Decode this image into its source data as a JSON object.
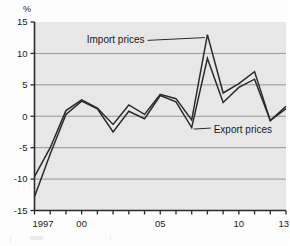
{
  "figure": {
    "unit_label": "%",
    "background_color": "#fdfdfd",
    "plot_background_color": "#e7e7e7"
  },
  "chart_data": {
    "type": "line",
    "title": "",
    "xlabel": "",
    "ylabel": "%",
    "ylim": [
      -15,
      15
    ],
    "ytick_values": [
      15,
      10,
      5,
      0,
      -5,
      -10,
      -15
    ],
    "ytick_labels": [
      "15",
      "10",
      "5",
      "0",
      "-5",
      "-10",
      "-15"
    ],
    "xlim": [
      1997,
      2013
    ],
    "xtick_values": [
      1997,
      1998,
      1999,
      2000,
      2001,
      2002,
      2003,
      2004,
      2005,
      2006,
      2007,
      2008,
      2009,
      2010,
      2011,
      2012,
      2013
    ],
    "xtick_labels": [
      "1997",
      "",
      "",
      "00",
      "",
      "",
      "",
      "",
      "05",
      "",
      "",
      "",
      "",
      "10",
      "",
      "",
      "13"
    ],
    "x": [
      1997,
      1998,
      1999,
      2000,
      2001,
      2002,
      2003,
      2004,
      2005,
      2006,
      2007,
      2008,
      2009,
      2010,
      2011,
      2012,
      2013
    ],
    "grid": true,
    "grid_axis": "y",
    "legend_position": "annotations-inline",
    "series": [
      {
        "name": "Import prices",
        "color": "#2b2b2b",
        "values": [
          -9.6,
          -5.0,
          0.9,
          2.6,
          1.3,
          -1.3,
          1.8,
          0.3,
          3.5,
          2.8,
          -0.6,
          13.0,
          3.7,
          5.2,
          7.1,
          -0.7,
          1.6
        ]
      },
      {
        "name": "Export prices",
        "color": "#2b2b2b",
        "values": [
          -12.8,
          -6.0,
          0.3,
          2.4,
          1.2,
          -2.5,
          0.8,
          -0.4,
          3.3,
          2.3,
          -1.8,
          9.2,
          2.2,
          4.6,
          5.9,
          -0.7,
          1.2
        ]
      }
    ],
    "annotations": [
      {
        "text": "Import prices",
        "anchor_x": 2008,
        "anchor_y": 13.0,
        "label_x": 2004.0,
        "label_y": 11.6
      },
      {
        "text": "Export prices",
        "anchor_x": 2007,
        "anchor_y": -1.8,
        "label_x": 2008.4,
        "label_y": -2.6
      }
    ]
  }
}
